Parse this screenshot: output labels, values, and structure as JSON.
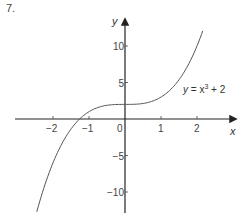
{
  "problem_number": "7.",
  "chart_data": {
    "type": "line",
    "title": "",
    "xlabel": "x",
    "ylabel": "y",
    "function": "y = x^3 + 2",
    "series": [
      {
        "name": "y = x³ + 2",
        "x": [
          -2.45,
          -2.2,
          -2.0,
          -1.8,
          -1.6,
          -1.4,
          -1.26,
          -1.0,
          -0.8,
          -0.6,
          -0.4,
          -0.2,
          0,
          0.2,
          0.4,
          0.6,
          0.8,
          1.0,
          1.2,
          1.4,
          1.6,
          1.8,
          2.0,
          2.16
        ],
        "values": [
          -12.71,
          -8.65,
          -6.0,
          -3.83,
          -2.1,
          -0.74,
          0.0,
          1.0,
          1.49,
          1.78,
          1.94,
          1.99,
          2.0,
          2.01,
          2.06,
          2.22,
          2.51,
          3.0,
          3.73,
          4.74,
          6.1,
          7.83,
          10.0,
          12.08
        ]
      }
    ],
    "x_ticks": [
      -2,
      -1,
      0,
      1,
      2
    ],
    "x_tick_labels": [
      "−2",
      "−1",
      "0",
      "1",
      "2"
    ],
    "y_ticks": [
      10,
      5,
      -5,
      -10
    ],
    "y_tick_labels": [
      "10",
      "5",
      "−5",
      "−10"
    ],
    "xlim": [
      -3.05,
      3.1
    ],
    "ylim": [
      -12.9,
      13.0
    ],
    "annotations": [
      {
        "text": "y = x³ + 2",
        "x": 1.6,
        "y": 4
      }
    ],
    "grid": false,
    "legend": "none"
  },
  "labels": {
    "x_axis": "x",
    "y_axis": "y",
    "curve_label_y": "y",
    "curve_label_eq": " = x",
    "curve_label_exp": "3",
    "curve_label_tail": " + 2"
  }
}
